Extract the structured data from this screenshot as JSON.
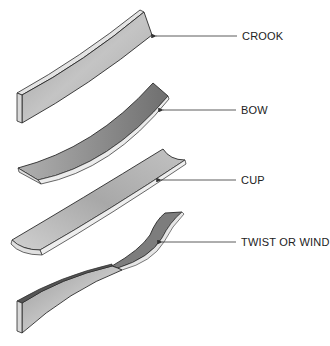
{
  "diagram": {
    "type": "lumber-warp-types",
    "items": [
      {
        "id": "crook",
        "label": "CROOK",
        "label_pos": [
          242,
          30
        ],
        "arrow_from": [
          237,
          36
        ],
        "arrow_to": [
          154,
          36
        ]
      },
      {
        "id": "bow",
        "label": "BOW",
        "label_pos": [
          241,
          104
        ],
        "arrow_from": [
          236,
          110
        ],
        "arrow_to": [
          161,
          110
        ]
      },
      {
        "id": "cup",
        "label": "CUP",
        "label_pos": [
          241,
          174
        ],
        "arrow_from": [
          236,
          180
        ],
        "arrow_to": [
          159,
          180
        ]
      },
      {
        "id": "twist",
        "label": "TWIST OR WIND",
        "label_pos": [
          241,
          236
        ],
        "arrow_from": [
          236,
          242
        ],
        "arrow_to": [
          160,
          242
        ]
      }
    ],
    "colors": {
      "board_face": "#b8b8b8",
      "board_face_dark": "#8a8a8a",
      "board_edge": "#e4e4e4",
      "outline": "#2a2a2a",
      "leader": "#333333"
    }
  }
}
